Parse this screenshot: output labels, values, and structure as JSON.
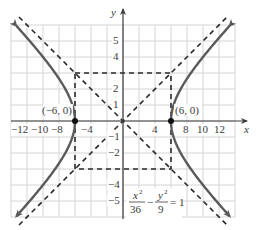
{
  "figure": {
    "type": "hyperbola-graph",
    "equation": {
      "x_num": "x",
      "x_den": "36",
      "y_num": "y",
      "y_den": "9",
      "minus": "−",
      "equals": "= 1",
      "sup": "2"
    },
    "axes": {
      "x_label": "x",
      "y_label": "y",
      "x_tick_labels": [
        "−12",
        "−10",
        "−8",
        "−4",
        "4",
        "8",
        "10",
        "12"
      ],
      "y_tick_labels_pos": [
        "5",
        "4",
        "2",
        "1"
      ],
      "y_tick_labels_neg": [
        "−1",
        "−2",
        "−4",
        "−5"
      ]
    },
    "points": [
      {
        "label": "(−6, 0)",
        "x": -6,
        "y": 0
      },
      {
        "label": "(6, 0)",
        "x": 6,
        "y": 0
      }
    ],
    "colors": {
      "curve": "#5a5a5a",
      "grid": "#d4d4d4",
      "axis": "#3a3a3a",
      "dashed": "#2a2a2a"
    }
  },
  "chart_data": {
    "type": "line",
    "xlabel": "x",
    "ylabel": "y",
    "xlim": [
      -14,
      14
    ],
    "ylim": [
      -6,
      6
    ],
    "grid": true,
    "series": [
      {
        "name": "hyperbola right branch",
        "equation": "x = 6*sqrt(1 + y^2/9)",
        "vertex": [
          6,
          0
        ]
      },
      {
        "name": "hyperbola left branch",
        "equation": "x = -6*sqrt(1 + y^2/9)",
        "vertex": [
          -6,
          0
        ]
      },
      {
        "name": "asymptote 1",
        "equation": "y = x/2",
        "style": "dashed"
      },
      {
        "name": "asymptote 2",
        "equation": "y = -x/2",
        "style": "dashed"
      },
      {
        "name": "fundamental rectangle",
        "corners": [
          [
            -6,
            3
          ],
          [
            6,
            3
          ],
          [
            6,
            -3
          ],
          [
            -6,
            -3
          ]
        ],
        "style": "dashed"
      }
    ],
    "annotations": [
      "(−6, 0)",
      "(6, 0)",
      "x^2/36 − y^2/9 = 1"
    ],
    "x_ticks": [
      -12,
      -10,
      -8,
      -4,
      4,
      8,
      10,
      12
    ],
    "y_ticks": [
      -5,
      -4,
      -2,
      -1,
      1,
      2,
      4,
      5
    ]
  }
}
